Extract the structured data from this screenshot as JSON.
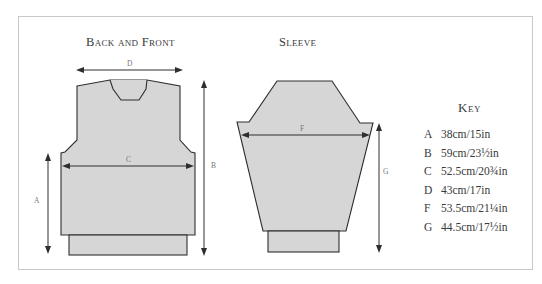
{
  "titles": {
    "back_front": "Back and Front",
    "sleeve": "Sleeve"
  },
  "labels": {
    "A": "A",
    "B": "B",
    "C": "C",
    "D": "D",
    "F": "F",
    "G": "G"
  },
  "colors": {
    "piece_fill": "#d6d6d6",
    "outline": "#2e2e2e",
    "frame": "#c8c8c8"
  },
  "key": {
    "title": "Key",
    "items": [
      {
        "letter": "A",
        "value": "38cm/15in"
      },
      {
        "letter": "B",
        "value": "59cm/23½in"
      },
      {
        "letter": "C",
        "value": "52.5cm/20¾in"
      },
      {
        "letter": "D",
        "value": "43cm/17in"
      },
      {
        "letter": "F",
        "value": "53.5cm/21¼in"
      },
      {
        "letter": "G",
        "value": "44.5cm/17½in"
      }
    ]
  }
}
